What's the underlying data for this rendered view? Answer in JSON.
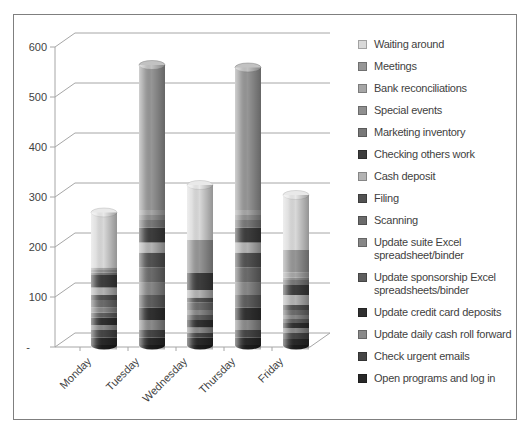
{
  "chart_data": {
    "type": "bar",
    "variant": "3d-stacked-cylinder",
    "title": "",
    "xlabel": "",
    "ylabel": "",
    "categories": [
      "Monday",
      "Tuesday",
      "Wednesday",
      "Thursday",
      "Friday"
    ],
    "category_totals": [
      265,
      560,
      320,
      555,
      300
    ],
    "ylim": [
      0,
      600
    ],
    "y_ticks": [
      0,
      100,
      200,
      300,
      400,
      500,
      600
    ],
    "y_tick_labels": [
      "-",
      "100",
      "200",
      "300",
      "400",
      "500",
      "600"
    ],
    "grid": true,
    "legend_position": "right",
    "stack_order": "last-legend-item-at-bottom",
    "series": [
      {
        "name": "Waiting around",
        "color": "#d9d9d9",
        "values": [
          110,
          0,
          110,
          0,
          110
        ]
      },
      {
        "name": "Meetings",
        "color": "#969696",
        "values": [
          0,
          290,
          65,
          285,
          45
        ]
      },
      {
        "name": "Bank reconciliations",
        "color": "#a6a6a6",
        "values": [
          5,
          10,
          0,
          10,
          10
        ]
      },
      {
        "name": "Special events",
        "color": "#8f8f8f",
        "values": [
          5,
          10,
          0,
          10,
          5
        ]
      },
      {
        "name": "Marketing inventory",
        "color": "#787878",
        "values": [
          5,
          15,
          0,
          15,
          10
        ]
      },
      {
        "name": "Checking others work",
        "color": "#3d3d3d",
        "values": [
          25,
          30,
          35,
          30,
          20
        ]
      },
      {
        "name": "Cash deposit",
        "color": "#b3b3b3",
        "values": [
          15,
          20,
          15,
          20,
          20
        ]
      },
      {
        "name": "Filing",
        "color": "#525252",
        "values": [
          10,
          30,
          10,
          30,
          10
        ]
      },
      {
        "name": "Scanning",
        "color": "#6b6b6b",
        "values": [
          15,
          30,
          15,
          30,
          10
        ]
      },
      {
        "name": "Update suite Excel spreadsheet/binder",
        "color": "#878787",
        "values": [
          10,
          25,
          10,
          25,
          8
        ]
      },
      {
        "name": "Update sponsorship Excel spreadsheets/binder",
        "color": "#5e5e5e",
        "values": [
          10,
          25,
          10,
          25,
          8
        ]
      },
      {
        "name": "Update credit card deposits",
        "color": "#303030",
        "values": [
          15,
          25,
          15,
          25,
          10
        ]
      },
      {
        "name": "Update daily cash roll forward",
        "color": "#8a8a8a",
        "values": [
          10,
          20,
          10,
          20,
          10
        ]
      },
      {
        "name": "Check urgent emails",
        "color": "#454545",
        "values": [
          15,
          15,
          10,
          15,
          12
        ]
      },
      {
        "name": "Open programs and log in",
        "color": "#282828",
        "values": [
          15,
          15,
          15,
          15,
          12
        ]
      }
    ],
    "colors": {
      "background": "#ffffff",
      "plot_border": "#7f7f7f",
      "gridline": "#a6a6a6",
      "axis_text": "#3f3f3f",
      "legend_text": "#3f3f3f"
    }
  }
}
